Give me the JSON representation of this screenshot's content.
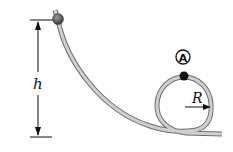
{
  "diagram": {
    "type": "physics loop-the-loop track",
    "labels": {
      "height": "h",
      "radius": "R",
      "point": "A"
    },
    "colors": {
      "track": "#a8a8a8",
      "track_edge": "#6e6e6e",
      "ball": "#555555",
      "marker": "#111111",
      "lines": "#111111"
    }
  }
}
